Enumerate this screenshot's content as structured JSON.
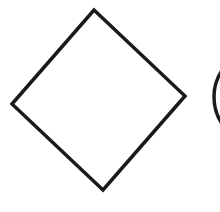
{
  "diagram": {
    "shapes": [
      {
        "type": "diamond",
        "role": "decision",
        "label": "",
        "stroke": "#1a1a1a",
        "fill": "#ffffff"
      },
      {
        "type": "circle",
        "role": "connector",
        "label": "",
        "stroke": "#1a1a1a",
        "fill": "#ffffff",
        "partially_visible": true
      }
    ]
  }
}
